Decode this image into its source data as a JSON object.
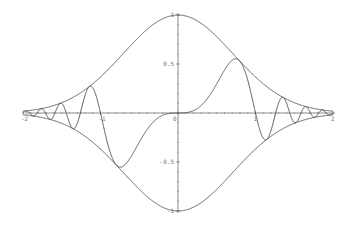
{
  "chart_data": {
    "type": "line",
    "title": "",
    "xlabel": "",
    "ylabel": "",
    "xlim": [
      -2,
      2
    ],
    "ylim": [
      -1,
      1
    ],
    "grid": false,
    "legend": null,
    "x_ticks": [
      {
        "value": -2,
        "label": "-2"
      },
      {
        "value": -1,
        "label": "-1"
      },
      {
        "value": 0,
        "label": "0"
      },
      {
        "value": 1,
        "label": "1"
      },
      {
        "value": 2,
        "label": "2"
      }
    ],
    "y_ticks": [
      {
        "value": 1,
        "label": "1"
      },
      {
        "value": 0.5,
        "label": "0.5"
      },
      {
        "value": -0.5,
        "label": "-0.5"
      },
      {
        "value": -1,
        "label": "-1"
      }
    ],
    "series": [
      {
        "name": "upper envelope",
        "expression": "exp(-x^2)",
        "x": [
          -2,
          -1.5,
          -1,
          -0.5,
          0,
          0.5,
          1,
          1.5,
          2
        ],
        "values": [
          0.018,
          0.105,
          0.368,
          0.779,
          1.0,
          0.779,
          0.368,
          0.105,
          0.018
        ]
      },
      {
        "name": "lower envelope",
        "expression": "-exp(-x^2)",
        "x": [
          -2,
          -1.5,
          -1,
          -0.5,
          0,
          0.5,
          1,
          1.5,
          2
        ],
        "values": [
          -0.018,
          -0.105,
          -0.368,
          -0.779,
          -1.0,
          -0.779,
          -0.368,
          -0.105,
          -0.018
        ]
      },
      {
        "name": "damped oscillation",
        "expression": "exp(-x^2)*sin(pi*x^3)",
        "x": [
          -1.1,
          -1.0,
          -0.78,
          -0.5,
          0,
          0.5,
          0.78,
          1.0,
          1.1
        ],
        "values": [
          0.27,
          0.0,
          -0.56,
          -0.3,
          0.0,
          0.3,
          0.56,
          0.0,
          -0.27
        ]
      }
    ],
    "annotations": []
  }
}
